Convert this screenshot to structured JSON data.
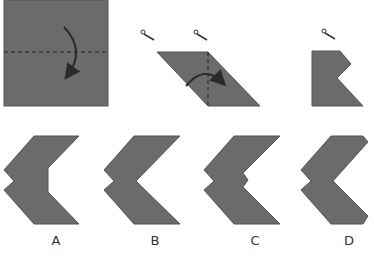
{
  "diagram": {
    "type": "paper-folding-puzzle",
    "steps": [
      {
        "id": "step-1",
        "description": "square folded down along horizontal dashed line"
      },
      {
        "id": "step-2",
        "description": "parallelogram folded right along vertical dashed line, cut marks shown"
      },
      {
        "id": "step-3",
        "description": "folded shape with notch cut"
      }
    ],
    "colors": {
      "paper": "#6b6b6b",
      "paper_edge": "#555555",
      "fold_line": "#222222",
      "arrow": "#2b2b2b"
    },
    "options": [
      {
        "label": "A"
      },
      {
        "label": "B"
      },
      {
        "label": "C"
      },
      {
        "label": "D"
      }
    ]
  }
}
